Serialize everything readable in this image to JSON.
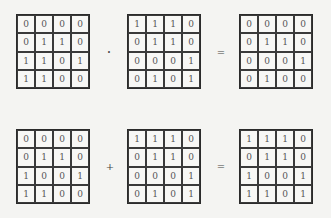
{
  "equations": [
    {
      "operator": "·",
      "equals": "=",
      "left": [
        [
          0,
          0,
          0,
          0
        ],
        [
          0,
          1,
          1,
          0
        ],
        [
          1,
          1,
          0,
          1
        ],
        [
          1,
          1,
          0,
          0
        ]
      ],
      "right": [
        [
          1,
          1,
          1,
          0
        ],
        [
          0,
          1,
          1,
          0
        ],
        [
          0,
          0,
          0,
          1
        ],
        [
          0,
          1,
          0,
          1
        ]
      ],
      "result": [
        [
          0,
          0,
          0,
          0
        ],
        [
          0,
          1,
          1,
          0
        ],
        [
          0,
          0,
          0,
          1
        ],
        [
          0,
          1,
          0,
          0
        ]
      ]
    },
    {
      "operator": "+",
      "equals": "=",
      "left": [
        [
          0,
          0,
          0,
          0
        ],
        [
          0,
          1,
          1,
          0
        ],
        [
          1,
          0,
          0,
          1
        ],
        [
          1,
          1,
          0,
          0
        ]
      ],
      "right": [
        [
          1,
          1,
          1,
          0
        ],
        [
          0,
          1,
          1,
          0
        ],
        [
          0,
          0,
          0,
          1
        ],
        [
          0,
          1,
          0,
          1
        ]
      ],
      "result": [
        [
          1,
          1,
          1,
          0
        ],
        [
          0,
          1,
          1,
          0
        ],
        [
          1,
          0,
          0,
          1
        ],
        [
          1,
          1,
          0,
          1
        ]
      ]
    }
  ]
}
